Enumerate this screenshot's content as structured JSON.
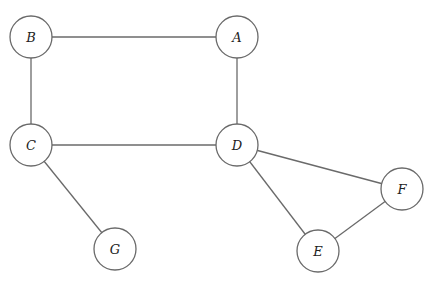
{
  "graph": {
    "nodes": [
      {
        "id": "A",
        "label": "A",
        "x": 237,
        "y": 37
      },
      {
        "id": "B",
        "label": "B",
        "x": 31,
        "y": 37
      },
      {
        "id": "C",
        "label": "C",
        "x": 31,
        "y": 145
      },
      {
        "id": "D",
        "label": "D",
        "x": 237,
        "y": 145
      },
      {
        "id": "E",
        "label": "E",
        "x": 318,
        "y": 251
      },
      {
        "id": "F",
        "label": "F",
        "x": 402,
        "y": 189
      },
      {
        "id": "G",
        "label": "G",
        "x": 115,
        "y": 249
      }
    ],
    "edges": [
      {
        "from": "B",
        "to": "A"
      },
      {
        "from": "B",
        "to": "C"
      },
      {
        "from": "A",
        "to": "D"
      },
      {
        "from": "C",
        "to": "D"
      },
      {
        "from": "C",
        "to": "G"
      },
      {
        "from": "D",
        "to": "F"
      },
      {
        "from": "D",
        "to": "E"
      },
      {
        "from": "E",
        "to": "F"
      }
    ],
    "node_radius": 21,
    "colors": {
      "stroke": "#6a6a6a",
      "text": "#222222",
      "background": "#ffffff"
    }
  }
}
